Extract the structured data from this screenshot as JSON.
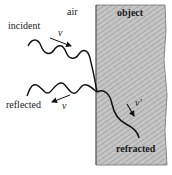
{
  "diagram": {
    "type": "wave-refraction-reflection",
    "regions": {
      "left": {
        "label": "air"
      },
      "right": {
        "label": "object"
      }
    },
    "waves": {
      "incident": {
        "label": "incident",
        "velocity_symbol": "v"
      },
      "reflected": {
        "label": "reflected",
        "velocity_symbol": "v"
      },
      "refracted": {
        "label": "refracted",
        "velocity_symbol": "v'"
      }
    },
    "colors": {
      "object_fill": "#bdbdbd",
      "object_hatch": "#8a8a8a",
      "wave_stroke": "#111111",
      "background": "#ffffff"
    }
  }
}
